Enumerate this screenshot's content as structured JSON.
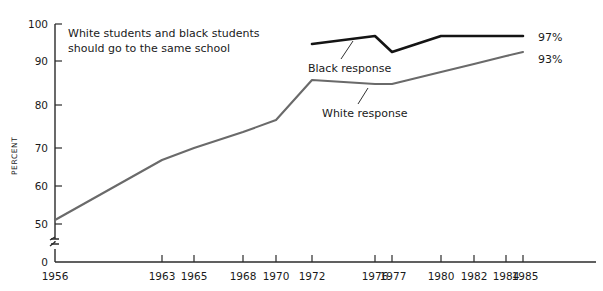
{
  "chart_data": {
    "type": "line",
    "title_line1": "White students and black students",
    "title_line2": "should go to the same school",
    "xlabel": "",
    "ylabel": "PERCENT",
    "ylim": [
      0,
      100
    ],
    "y_axis_break": true,
    "y_break_between": [
      0,
      50
    ],
    "grid": false,
    "legend_position": "inline-annotation",
    "y_ticks": [
      100,
      90,
      80,
      70,
      60,
      50,
      0
    ],
    "y_tick_labels": [
      "100",
      "90",
      "80",
      "70",
      "60",
      "50",
      "0"
    ],
    "x": [
      1956,
      1963,
      1965,
      1968,
      1970,
      1972,
      1976,
      1977,
      1980,
      1982,
      1984,
      1985
    ],
    "x_tick_labels": [
      "1956",
      "1963",
      "1965",
      "1968",
      "1970",
      "1972",
      "1976",
      "1977",
      "1980",
      "1982",
      "1984",
      "1985"
    ],
    "series": [
      {
        "name": "Black response",
        "label": "Black response",
        "color": "#141414",
        "end_label": "97%",
        "x": [
          1972,
          1976,
          1977,
          1980,
          1982,
          1984,
          1985
        ],
        "values": [
          95,
          97,
          93,
          97,
          97,
          97,
          97
        ]
      },
      {
        "name": "White response",
        "label": "White response",
        "color": "#6a6a6a",
        "end_label": "93%",
        "x": [
          1956,
          1963,
          1965,
          1968,
          1970,
          1972,
          1976,
          1977,
          1980,
          1982,
          1984,
          1985
        ],
        "values": [
          51,
          66,
          69,
          73,
          76,
          86,
          85,
          85,
          88,
          90,
          92,
          93
        ]
      }
    ]
  },
  "annotations": {
    "black_label": "Black response",
    "white_label": "White response",
    "black_end": "97%",
    "white_end": "93%"
  }
}
